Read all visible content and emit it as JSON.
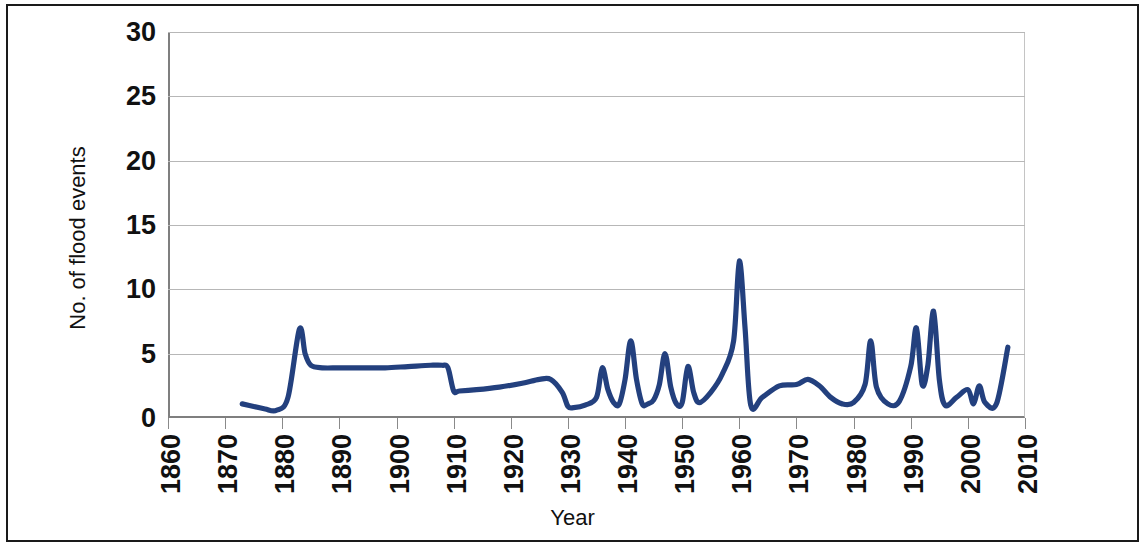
{
  "chart_data": {
    "type": "line",
    "title": "",
    "xlabel": "Year",
    "ylabel": "No. of flood events",
    "xlim": [
      1860,
      2010
    ],
    "ylim": [
      0,
      30
    ],
    "grid": true,
    "legend": "none",
    "line_color": "#23407e",
    "x_tick_labels": [
      "1860",
      "1870",
      "1880",
      "1890",
      "1900",
      "1910",
      "1920",
      "1930",
      "1940",
      "1950",
      "1960",
      "1970",
      "1980",
      "1990",
      "2000",
      "2010"
    ],
    "y_tick_labels": [
      "0",
      "5",
      "10",
      "15",
      "20",
      "25",
      "30"
    ],
    "x_ticks": [
      1860,
      1870,
      1880,
      1890,
      1900,
      1910,
      1920,
      1930,
      1940,
      1950,
      1960,
      1970,
      1980,
      1990,
      2000,
      2010
    ],
    "y_ticks": [
      0,
      5,
      10,
      15,
      20,
      25,
      30
    ],
    "series": [
      {
        "name": "No. of flood events",
        "x": [
          1873,
          1875,
          1877,
          1879,
          1881,
          1883,
          1884,
          1885,
          1887,
          1890,
          1894,
          1898,
          1902,
          1906,
          1908,
          1909,
          1910,
          1911,
          1914,
          1918,
          1922,
          1925,
          1927,
          1929,
          1930,
          1931,
          1933,
          1935,
          1936,
          1937,
          1938,
          1939,
          1940,
          1941,
          1942,
          1943,
          1944,
          1945,
          1946,
          1947,
          1948,
          1949,
          1950,
          1951,
          1952,
          1953,
          1955,
          1957,
          1959,
          1960,
          1961,
          1962,
          1964,
          1967,
          1970,
          1972,
          1974,
          1976,
          1978,
          1980,
          1982,
          1983,
          1984,
          1986,
          1988,
          1990,
          1991,
          1992,
          1993,
          1994,
          1995,
          1996,
          1998,
          2000,
          2001,
          2002,
          2003,
          2005,
          2007
        ],
        "y": [
          1.1,
          0.9,
          0.7,
          0.6,
          1.6,
          6.9,
          5.0,
          4.1,
          3.9,
          3.9,
          3.9,
          3.9,
          4.0,
          4.1,
          4.1,
          3.9,
          2.1,
          2.1,
          2.2,
          2.4,
          2.7,
          3.0,
          3.0,
          2.0,
          0.9,
          0.8,
          1.0,
          1.6,
          3.9,
          2.2,
          1.2,
          1.1,
          3.0,
          6.0,
          3.0,
          1.1,
          1.1,
          1.4,
          2.6,
          5.0,
          2.4,
          1.1,
          1.2,
          4.0,
          2.0,
          1.2,
          2.0,
          3.4,
          6.0,
          12.2,
          7.0,
          1.0,
          1.6,
          2.5,
          2.6,
          3.0,
          2.5,
          1.6,
          1.1,
          1.2,
          2.6,
          6.0,
          2.4,
          1.1,
          1.3,
          4.0,
          7.0,
          2.6,
          4.1,
          8.3,
          3.0,
          1.0,
          1.6,
          2.2,
          1.1,
          2.5,
          1.2,
          1.1,
          5.5
        ]
      }
    ]
  },
  "axis": {
    "y_title": "No. of flood events",
    "x_title": "Year"
  }
}
